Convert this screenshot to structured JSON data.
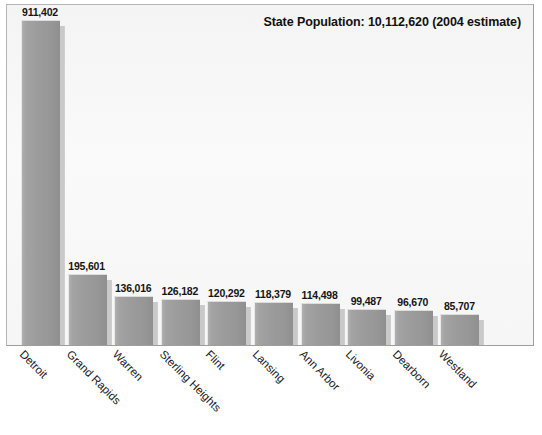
{
  "chart_data": {
    "type": "bar",
    "title": "State Population: 10,112,620 (2004 estimate)",
    "xlabel": "",
    "ylabel": "",
    "ylim": [
      0,
      911402
    ],
    "grid": false,
    "legend": "none",
    "orientation": "vertical",
    "categories": [
      "Detroit",
      "Grand Rapids",
      "Warren",
      "Sterling Heights",
      "Flint",
      "Lansing",
      "Ann Arbor",
      "Livonia",
      "Dearborn",
      "Westland"
    ],
    "values": [
      911402,
      195601,
      136016,
      126182,
      120292,
      118379,
      114498,
      99487,
      96670,
      85707
    ],
    "value_labels": [
      "911,402",
      "195,601",
      "136,016",
      "126,182",
      "120,292",
      "118,379",
      "114,498",
      "99,487",
      "96,670",
      "85,707"
    ],
    "bar_color": "#9b9b9b",
    "shadow_color": "#c9c9c9",
    "plot_background": "#f7f7f7",
    "text_color": "#111111"
  }
}
